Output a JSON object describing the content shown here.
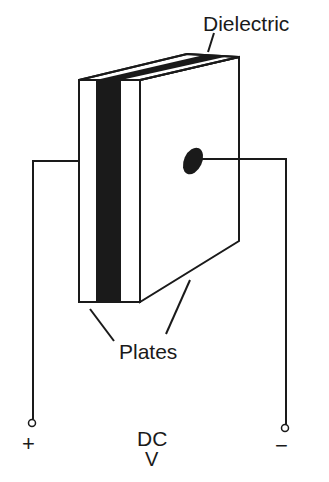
{
  "diagram": {
    "labels": {
      "dielectric": "Dielectric",
      "plates": "Plates",
      "source": "DC",
      "source_unit": "V",
      "positive_terminal": "+",
      "negative_terminal": "−"
    },
    "colors": {
      "ink": "#1a1a1a",
      "background": "#ffffff",
      "dielectric_fill": "#1a1a1a"
    }
  }
}
